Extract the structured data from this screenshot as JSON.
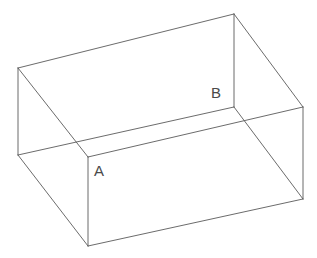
{
  "figure": {
    "background_color": "#ffffff",
    "line_color": "#5a5a5a",
    "label_color": "#4a4a4a",
    "width": 317,
    "height": 258,
    "labels": {
      "a": "A",
      "b": "B"
    },
    "vertices": {
      "top_back_left": [
        18,
        68
      ],
      "top_back_right": [
        234,
        14
      ],
      "top_front_right": [
        303,
        107
      ],
      "top_front_left": [
        88,
        157
      ],
      "bottom_back_left": [
        18,
        155
      ],
      "bottom_front_left": [
        88,
        246
      ],
      "bottom_front_right": [
        303,
        199
      ],
      "inner_corner_b": [
        234,
        107
      ]
    },
    "edges": [
      {
        "name": "top-rim-back-left",
        "from": "top_back_left",
        "to": "top_back_right",
        "path": "M18,68 L234,14"
      },
      {
        "name": "top-rim-back-right",
        "from": "top_back_right",
        "to": "top_front_right",
        "path": "M234,14 L303,107"
      },
      {
        "name": "top-rim-front-right",
        "from": "top_front_right",
        "to": "top_front_left",
        "path": "M303,107 L88,157"
      },
      {
        "name": "top-rim-front-left",
        "from": "top_front_left",
        "to": "top_back_left",
        "path": "M88,157 L18,68"
      },
      {
        "name": "vertical-left-edge",
        "from": "top_back_left",
        "to": "bottom_back_left",
        "path": "M18,68 L18,155"
      },
      {
        "name": "vertical-front-left-edge",
        "from": "top_front_left",
        "to": "bottom_front_left",
        "path": "M88,157 L88,246"
      },
      {
        "name": "vertical-front-right-edge",
        "from": "top_front_right",
        "to": "bottom_front_right",
        "path": "M303,107 L303,199"
      },
      {
        "name": "inner-vertical-back-right-edge",
        "from": "top_back_right",
        "to": "inner_corner_b",
        "path": "M234,14 L234,107"
      },
      {
        "name": "bottom-left-side",
        "from": "bottom_back_left",
        "to": "bottom_front_left",
        "path": "M18,155 L88,246"
      },
      {
        "name": "bottom-front-side",
        "from": "bottom_front_left",
        "to": "bottom_front_right",
        "path": "M88,246 L303,199"
      },
      {
        "name": "inner-floor-left",
        "from": "bottom_back_left",
        "to": "inner_corner_b",
        "path": "M18,155 L234,107"
      },
      {
        "name": "inner-floor-right",
        "from": "inner_corner_b",
        "to": "bottom_front_right",
        "path": "M234,107 L303,199"
      }
    ]
  }
}
